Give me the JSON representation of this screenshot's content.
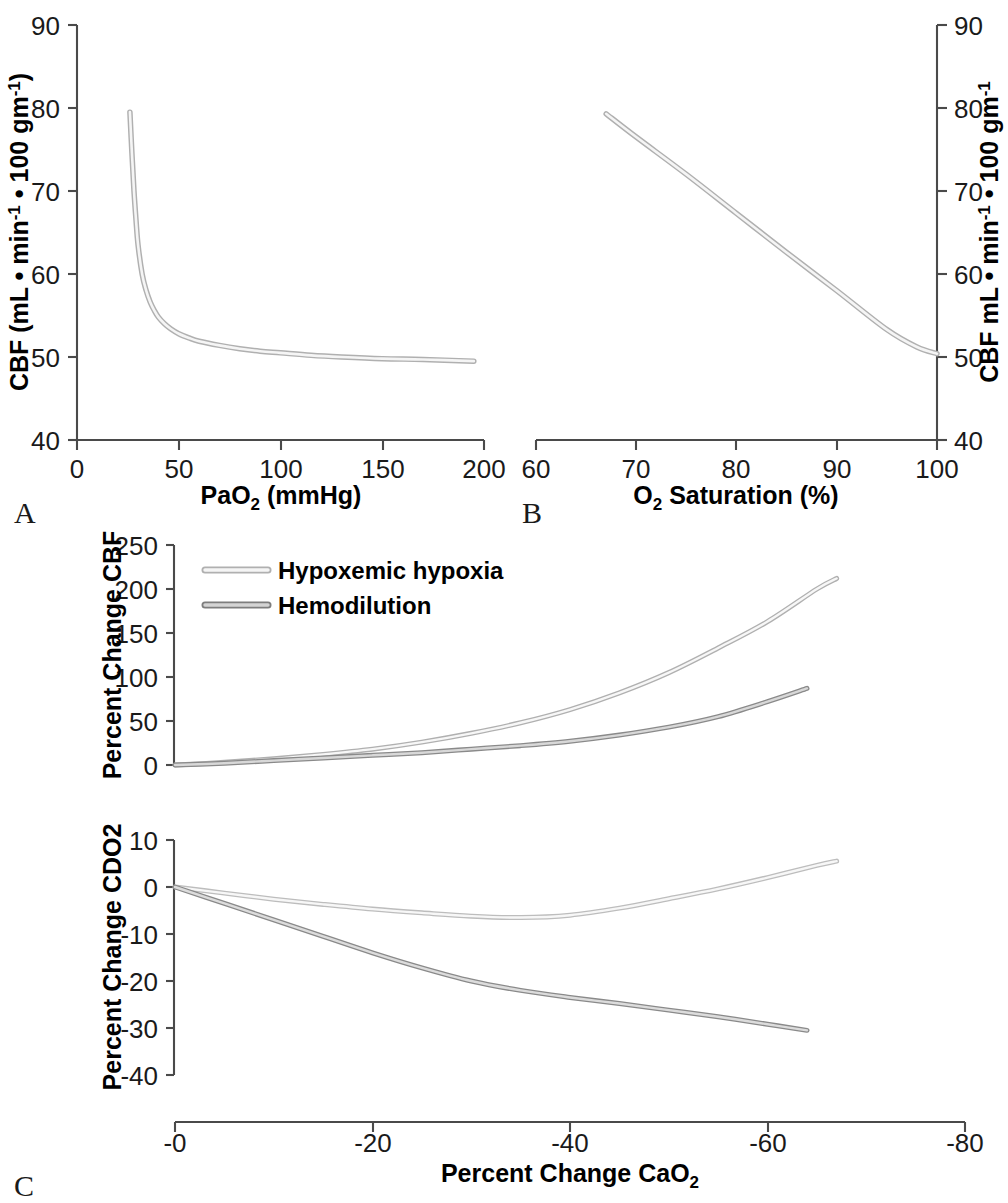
{
  "figure": {
    "panels": [
      {
        "letter": "A"
      },
      {
        "letter": "B"
      },
      {
        "letter": "C"
      }
    ]
  },
  "colors": {
    "axis": "#4a4a4a",
    "text": "#1a1a1a",
    "light_curve_outline": "#b8b8b8",
    "light_curve_fill": "#f2f2f2",
    "dark_curve_outline": "#777777",
    "dark_curve_fill": "#d8d8d8",
    "background": "#ffffff"
  },
  "panelA": {
    "letter": "A",
    "xlabel_main": "PaO",
    "xlabel_sub": "2",
    "xlabel_tail": " (mmHg)",
    "ylabel_parts": [
      "CBF (mL • min",
      "-1",
      " • 100 gm",
      "-1",
      ")"
    ],
    "xticks": [
      "0",
      "50",
      "100",
      "150",
      "200"
    ],
    "yticks": [
      "40",
      "50",
      "60",
      "70",
      "80",
      "90"
    ]
  },
  "panelB": {
    "letter": "B",
    "xlabel_main": "O",
    "xlabel_sub": "2",
    "xlabel_tail": " Saturation (%)",
    "ylabel_parts": [
      "CBF mL • min",
      "-1",
      " • 100 gm",
      "-1"
    ],
    "xticks": [
      "60",
      "70",
      "80",
      "90",
      "100"
    ],
    "yticks": [
      "40",
      "50",
      "60",
      "70",
      "80",
      "90"
    ]
  },
  "panelC": {
    "letter": "C",
    "xlabel_main": "Percent Change CaO",
    "xlabel_sub": "2",
    "xticks": [
      "-0",
      "-20",
      "-40",
      "-60",
      "-80"
    ],
    "top": {
      "ylabel": "Percent Change CBF",
      "yticks": [
        "0",
        "50",
        "100",
        "150",
        "200",
        "250"
      ]
    },
    "bottom": {
      "ylabel": "Percent Change CDO2",
      "yticks": [
        "-40",
        "-30",
        "-20",
        "-10",
        "0",
        "10"
      ]
    },
    "legend": [
      {
        "label": "Hypoxemic hypoxia",
        "style": "light"
      },
      {
        "label": "Hemodilution",
        "style": "dark"
      }
    ]
  },
  "chart_data": [
    {
      "type": "line",
      "id": "panel-a",
      "title": "",
      "xlabel": "PaO2 (mmHg)",
      "ylabel": "CBF (mL • min-1 • 100 gm-1)",
      "xlim": [
        0,
        200
      ],
      "ylim": [
        40,
        90
      ],
      "xticks": [
        0,
        50,
        100,
        150,
        200
      ],
      "yticks": [
        40,
        50,
        60,
        70,
        80,
        90
      ],
      "grid": false,
      "legend": "none",
      "series": [
        {
          "name": "CBF vs PaO2",
          "x": [
            26,
            27,
            28,
            29,
            30,
            32,
            34,
            36,
            38,
            40,
            43,
            46,
            50,
            55,
            60,
            70,
            80,
            90,
            100,
            115,
            130,
            150,
            170,
            195
          ],
          "y": [
            79.5,
            74.5,
            70.0,
            66.5,
            63.5,
            60.0,
            58.0,
            56.6,
            55.6,
            54.8,
            54.0,
            53.4,
            52.8,
            52.3,
            51.9,
            51.4,
            51.0,
            50.7,
            50.5,
            50.2,
            50.0,
            49.8,
            49.7,
            49.5
          ]
        }
      ]
    },
    {
      "type": "line",
      "id": "panel-b",
      "title": "",
      "xlabel": "O2 Saturation (%)",
      "ylabel": "CBF mL • min-1 • 100 gm-1",
      "xlim": [
        60,
        100
      ],
      "ylim": [
        40,
        90
      ],
      "xticks": [
        60,
        70,
        80,
        90,
        100
      ],
      "yticks": [
        40,
        50,
        60,
        70,
        80,
        90
      ],
      "grid": false,
      "legend": "none",
      "series": [
        {
          "name": "CBF vs O2 Saturation",
          "x": [
            67,
            70,
            75,
            80,
            85,
            90,
            95,
            98,
            100
          ],
          "y": [
            79.3,
            76.5,
            72.0,
            67.3,
            62.6,
            58.0,
            53.3,
            51.2,
            50.4
          ]
        }
      ]
    },
    {
      "type": "line",
      "id": "panel-c-top",
      "title": "",
      "xlabel": "Percent Change CaO2",
      "ylabel": "Percent Change CBF",
      "xlim": [
        0,
        -80
      ],
      "ylim": [
        0,
        250
      ],
      "xticks": [
        0,
        -20,
        -40,
        -60,
        -80
      ],
      "yticks": [
        0,
        50,
        100,
        150,
        200,
        250
      ],
      "grid": false,
      "legend": "top-left",
      "series": [
        {
          "name": "Hypoxemic hypoxia",
          "x": [
            0,
            -5,
            -10,
            -15,
            -20,
            -25,
            -30,
            -35,
            -40,
            -45,
            -50,
            -55,
            -60,
            -65,
            -67
          ],
          "y": [
            0,
            3,
            7,
            12,
            18,
            26,
            36,
            48,
            63,
            82,
            105,
            133,
            163,
            200,
            212
          ]
        },
        {
          "name": "Hemodilution",
          "x": [
            0,
            -5,
            -10,
            -15,
            -20,
            -25,
            -30,
            -35,
            -40,
            -45,
            -50,
            -55,
            -60,
            -64
          ],
          "y": [
            0,
            2,
            5,
            8,
            11,
            14,
            18,
            22,
            27,
            34,
            43,
            55,
            72,
            87
          ]
        }
      ]
    },
    {
      "type": "line",
      "id": "panel-c-bottom",
      "title": "",
      "xlabel": "Percent Change CaO2",
      "ylabel": "Percent Change CDO2",
      "xlim": [
        0,
        -80
      ],
      "ylim": [
        -40,
        10
      ],
      "xticks": [
        0,
        -20,
        -40,
        -60,
        -80
      ],
      "yticks": [
        -40,
        -30,
        -20,
        -10,
        0,
        10
      ],
      "grid": false,
      "legend": "none",
      "series": [
        {
          "name": "Hypoxemic hypoxia",
          "x": [
            0,
            -5,
            -10,
            -15,
            -20,
            -25,
            -30,
            -35,
            -40,
            -45,
            -50,
            -55,
            -60,
            -65,
            -67
          ],
          "y": [
            0,
            -1.3,
            -2.6,
            -3.7,
            -4.7,
            -5.5,
            -6.2,
            -6.5,
            -6.0,
            -4.5,
            -2.5,
            -0.4,
            2.0,
            4.6,
            5.5
          ]
        },
        {
          "name": "Hemodilution",
          "x": [
            0,
            -5,
            -10,
            -15,
            -20,
            -25,
            -30,
            -35,
            -40,
            -45,
            -50,
            -55,
            -60,
            -64
          ],
          "y": [
            0,
            -3.5,
            -7.0,
            -10.5,
            -14.0,
            -17.2,
            -20.0,
            -22.0,
            -23.5,
            -24.8,
            -26.2,
            -27.6,
            -29.2,
            -30.5
          ]
        }
      ]
    }
  ]
}
